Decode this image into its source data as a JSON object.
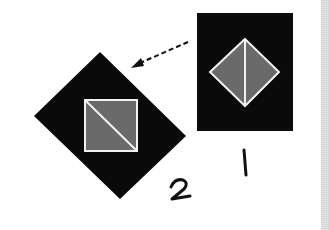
{
  "diagram": {
    "colors": {
      "background": "#ffffff",
      "block": "#0a0a0a",
      "patch": "#6a6a6a",
      "seam": "#f2f2f2",
      "arrow": "#111111",
      "edge_strip": "#cfcfcf"
    },
    "blocks": [
      {
        "id": "block-1",
        "label": "1",
        "shape": "rectangle",
        "outer": {
          "x": 197,
          "y": 13,
          "width": 96,
          "height": 118
        },
        "inner_diamond": {
          "top": [
            245,
            39
          ],
          "right": [
            279,
            72
          ],
          "bottom": [
            245,
            106
          ],
          "left": [
            210,
            72
          ]
        },
        "seam": "vertical"
      },
      {
        "id": "block-2",
        "label": "2",
        "shape": "rotated-rectangle",
        "outer": {
          "top": [
            100,
            52
          ],
          "right": [
            186,
            136
          ],
          "bottom": [
            120,
            199
          ],
          "left": [
            34,
            116
          ]
        },
        "inner_square": {
          "x": 85,
          "y": 100,
          "width": 52,
          "height": 51
        },
        "seam": "diagonal"
      }
    ],
    "arrow": {
      "from": [
        188,
        42
      ],
      "to": [
        133,
        67
      ],
      "style": "dashed"
    },
    "labels": {
      "one": "1",
      "two": "2"
    }
  }
}
